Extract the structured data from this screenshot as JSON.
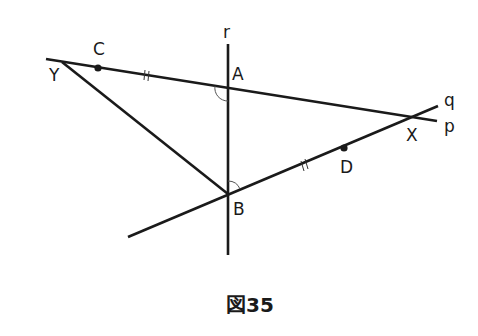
{
  "figure": {
    "caption": "図35",
    "labels": {
      "r": "r",
      "p": "p",
      "q": "q",
      "A": "A",
      "B": "B",
      "C": "C",
      "D": "D",
      "X": "X",
      "Y": "Y"
    },
    "points": {
      "A": [
        228,
        88
      ],
      "B": [
        228,
        194
      ],
      "C": [
        98,
        68
      ],
      "D": [
        344,
        148
      ],
      "X": [
        412,
        116
      ],
      "Y": [
        62,
        62
      ]
    },
    "lines": {
      "p": {
        "from": [
          46,
          59
        ],
        "to": [
          437,
          121
        ]
      },
      "q": {
        "from": [
          128,
          237
        ],
        "to": [
          438,
          106
        ]
      },
      "r": {
        "from": [
          228,
          44
        ],
        "to": [
          228,
          255
        ]
      },
      "YB": {
        "from": [
          62,
          62
        ],
        "to": [
          228,
          194
        ]
      }
    },
    "marks": {
      "equal_ticks": [
        "CA",
        "BD"
      ],
      "equal_angles": [
        "angle at A (between p and r, lower-left)",
        "angle at B (between r and q, upper-right)"
      ]
    },
    "colors": {
      "line": "#1a1a1a",
      "background": "#ffffff"
    }
  }
}
